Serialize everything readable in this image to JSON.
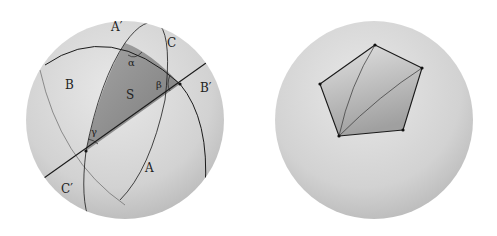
{
  "left_figure": {
    "description": "Spherical triangle formed by three great circles",
    "labels": {
      "A_prime": "A′",
      "B": "B",
      "B_prime": "B′",
      "C": "C",
      "C_prime": "C′",
      "A": "A",
      "S": "S",
      "alpha": "α",
      "beta": "β",
      "gamma": "γ"
    },
    "colors": {
      "sphere": "#d6d6d6",
      "triangle": "#8a8a8a",
      "line": "#1a1a1a"
    }
  },
  "right_figure": {
    "description": "Spherical pentagon triangulated from one vertex",
    "vertex_count": 5
  }
}
